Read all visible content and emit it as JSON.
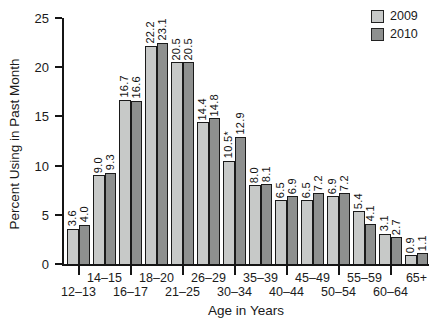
{
  "chart_data": {
    "type": "bar",
    "title": "",
    "xlabel": "Age in Years",
    "ylabel": "Percent Using in Past Month",
    "ylim": [
      0,
      25
    ],
    "yticks": [
      0,
      5,
      10,
      15,
      20,
      25
    ],
    "grid": false,
    "legend_position": "top-right",
    "categories": [
      "12–13",
      "14–15",
      "16–17",
      "18–20",
      "21–25",
      "26–29",
      "30–34",
      "35–39",
      "40–44",
      "45–49",
      "50–54",
      "55–59",
      "60–64",
      "65+"
    ],
    "series": [
      {
        "name": "2009",
        "color": "#c7c9c8",
        "values": [
          3.6,
          9.0,
          16.7,
          22.2,
          20.5,
          14.4,
          10.5,
          8.0,
          6.5,
          6.5,
          6.9,
          5.4,
          3.1,
          0.9
        ],
        "labels": [
          "3.6",
          "9.0",
          "16.7",
          "22.2",
          "20.5",
          "14.4",
          "10.5*",
          "8.0",
          "6.5",
          "6.5",
          "6.9",
          "5.4",
          "3.1",
          "0.9"
        ]
      },
      {
        "name": "2010",
        "color": "#8e908f",
        "values": [
          4.0,
          9.3,
          16.6,
          23.1,
          20.5,
          14.8,
          12.9,
          8.1,
          6.9,
          7.2,
          7.2,
          4.1,
          2.7,
          1.1
        ],
        "labels": [
          "4.0",
          "9.3",
          "16.6",
          "23.1",
          "20.5",
          "14.8",
          "12.9",
          "8.1",
          "6.9",
          "7.2",
          "7.2",
          "4.1",
          "2.7",
          "1.1"
        ]
      }
    ],
    "axis_color": "#151515",
    "bar_border_color": "#1a1a1a"
  }
}
